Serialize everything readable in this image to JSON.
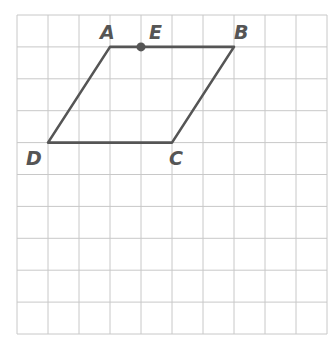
{
  "diagram": {
    "type": "parallelogram-on-grid",
    "grid": {
      "columns": 10,
      "rows": 10,
      "origin_px": [
        17,
        15
      ],
      "cell_w_px": 31,
      "cell_h_px": 31.9,
      "line_color": "#c8c8c8"
    },
    "stroke_color": "#555555",
    "points": {
      "A": {
        "label": "A",
        "col": 3,
        "row": 1
      },
      "E": {
        "label": "E",
        "col": 4,
        "row": 1,
        "marked": true
      },
      "B": {
        "label": "B",
        "col": 7,
        "row": 1
      },
      "C": {
        "label": "C",
        "col": 5,
        "row": 4
      },
      "D": {
        "label": "D",
        "col": 1,
        "row": 4
      }
    },
    "segments": [
      [
        "A",
        "B"
      ],
      [
        "B",
        "C"
      ],
      [
        "C",
        "D"
      ],
      [
        "D",
        "A"
      ]
    ],
    "labels": {
      "A": "A",
      "E": "E",
      "B": "B",
      "C": "C",
      "D": "D"
    }
  }
}
